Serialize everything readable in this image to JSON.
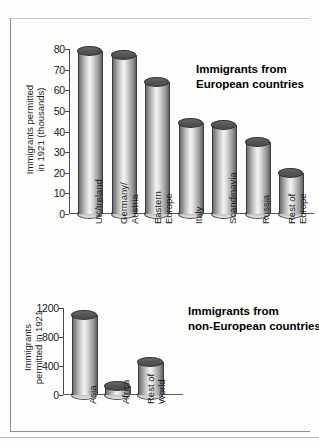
{
  "page": {
    "background_color": "#fdfdfc",
    "border_color": "#8d8d8d"
  },
  "chart_data": [
    {
      "id": "european",
      "type": "bar",
      "title": "Immigrants from\nEuropean countries",
      "title_line1": "Immigrants from",
      "title_line2": "European countries",
      "ylabel": "Immigrants permitted\nin 1921 (thousands)",
      "ylabel_line1": "Immigrants permitted",
      "ylabel_line2": "in 1921 (thousands)",
      "xlabel": "",
      "ylim": [
        0,
        80
      ],
      "yticks": [
        0,
        10,
        20,
        30,
        40,
        50,
        60,
        70,
        80
      ],
      "grid": false,
      "legend": "none",
      "categories": [
        "UK/Ireland",
        "Germany/\nAustria",
        "Eastern\nEurope",
        "Italy",
        "Scandinavia",
        "Russia",
        "Rest of\nEurope"
      ],
      "category_lines": [
        [
          "UK/Ireland"
        ],
        [
          "Germany/",
          "Austria"
        ],
        [
          "Eastern",
          "Europe"
        ],
        [
          "Italy"
        ],
        [
          "Scandinavia"
        ],
        [
          "Russia"
        ],
        [
          "Rest of",
          "Europe"
        ]
      ],
      "values": [
        79,
        77,
        64,
        44,
        43,
        35,
        20
      ]
    },
    {
      "id": "non-european",
      "type": "bar",
      "title": "Immigrants from\nnon-European countries",
      "title_line1": "Immigrants from",
      "title_line2": "non-European countries",
      "ylabel": "Immigrants\npermitted in 1921",
      "ylabel_line1": "Immigrants",
      "ylabel_line2": "permitted in 1921",
      "xlabel": "",
      "ylim": [
        0,
        1200
      ],
      "yticks": [
        0,
        400,
        800,
        1200
      ],
      "grid": false,
      "legend": "none",
      "categories": [
        "Asia",
        "Africa",
        "Rest of\nWorld"
      ],
      "category_lines": [
        [
          "Asia"
        ],
        [
          "Africa"
        ],
        [
          "Rest of",
          "World"
        ]
      ],
      "values": [
        1100,
        120,
        450
      ]
    }
  ]
}
